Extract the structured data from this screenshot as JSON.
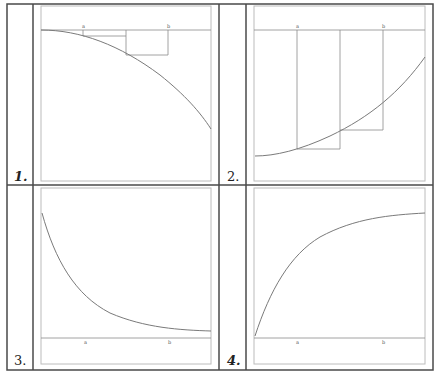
{
  "figure": {
    "title": "",
    "colors": {
      "frame": "#4a4a4a",
      "inner_frame": "#b8b8b8",
      "axis": "#8a8a8a",
      "curve": "#7a7a7a",
      "rect": "#8a8a8a"
    }
  },
  "panels": [
    {
      "label": "1.",
      "description": "decreasing concave-down curve with axis at top; rectangles between a and b",
      "ticks": [
        "a",
        "b"
      ]
    },
    {
      "label": "2.",
      "description": "increasing concave-up curve below axis at top; rectangles from a to b hanging down to curve",
      "ticks": [
        "a",
        "b"
      ]
    },
    {
      "label": "3.",
      "description": "decreasing convex curve approaching axis at bottom",
      "ticks": [
        "a",
        "b"
      ]
    },
    {
      "label": "4.",
      "description": "increasing concave-down curve rising from axis at bottom",
      "ticks": [
        "a",
        "b"
      ]
    }
  ]
}
